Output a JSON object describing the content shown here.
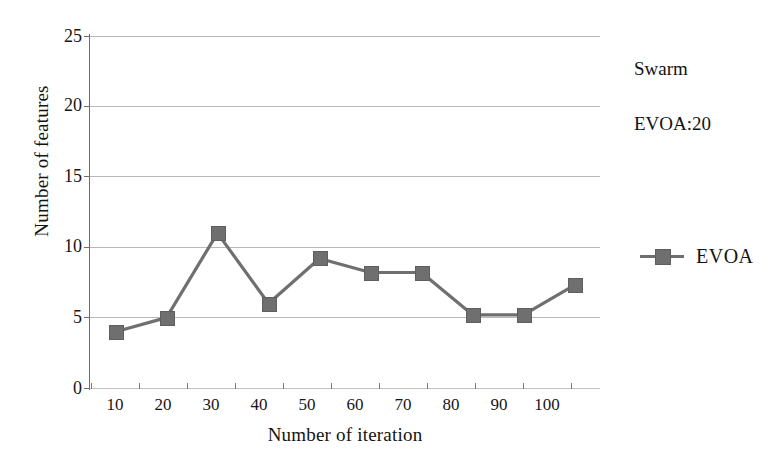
{
  "chart_data": {
    "type": "line",
    "title": "",
    "xlabel": "Number of iteration",
    "ylabel": "Number of features",
    "categories": [
      "10",
      "20",
      "30",
      "40",
      "50",
      "60",
      "70",
      "80",
      "90",
      "100"
    ],
    "series": [
      {
        "name": "EVOA",
        "values": [
          4,
          5,
          11,
          6,
          9.2,
          8.2,
          8.2,
          5.2,
          5.2,
          7.3
        ],
        "color": "#6f6f6f",
        "marker": "square"
      }
    ],
    "ylim": [
      0,
      25
    ],
    "yticks": [
      "0",
      "5",
      "10",
      "15",
      "20",
      "25"
    ],
    "grid": true,
    "legend_position": "right",
    "annotations": [
      "Swarm",
      "EVOA:20"
    ]
  },
  "axes": {
    "y_title": "Number of features",
    "x_title": "Number of iteration",
    "y_ticks": [
      "25",
      "20",
      "15",
      "10",
      "5",
      "0"
    ],
    "x_ticks": [
      "10",
      "20",
      "30",
      "40",
      "50",
      "60",
      "70",
      "80",
      "90",
      "100"
    ]
  },
  "annotations": {
    "swarm": "Swarm",
    "evoa_count": "EVOA:20"
  },
  "legend": {
    "entries": [
      {
        "label": "EVOA",
        "color": "#6f6f6f"
      }
    ]
  },
  "colors": {
    "series": "#6f6f6f",
    "gridline": "#b9b9b9",
    "axis": "#6d6d6d",
    "text": "#131313",
    "background": "#ffffff"
  }
}
